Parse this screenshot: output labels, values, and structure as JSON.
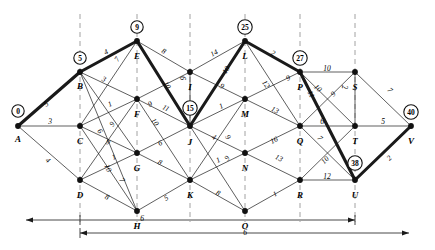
{
  "figure": {
    "type": "network-shortest-path-diagram"
  },
  "nodes": [
    {
      "id": "A",
      "label": "A",
      "x": 18,
      "y": 126,
      "potential": "0",
      "pot_x": 18,
      "pot_y": 111,
      "lab_dx": 0,
      "lab_dy": 8
    },
    {
      "id": "B",
      "label": "B",
      "x": 80,
      "y": 72,
      "potential": "5",
      "pot_x": 80,
      "pot_y": 58,
      "lab_dx": 0,
      "lab_dy": 9
    },
    {
      "id": "C",
      "label": "C",
      "x": 80,
      "y": 126,
      "potential": null,
      "lab_dx": 0,
      "lab_dy": 10
    },
    {
      "id": "D",
      "label": "D",
      "x": 80,
      "y": 180,
      "potential": null,
      "lab_dx": 0,
      "lab_dy": 10
    },
    {
      "id": "E",
      "label": "E",
      "x": 137,
      "y": 41,
      "potential": "9",
      "pot_x": 137,
      "pot_y": 27,
      "lab_dx": 0,
      "lab_dy": 10
    },
    {
      "id": "F",
      "label": "F",
      "x": 137,
      "y": 99,
      "potential": null,
      "lab_dx": 0,
      "lab_dy": 10
    },
    {
      "id": "G",
      "label": "G",
      "x": 137,
      "y": 153,
      "potential": null,
      "lab_dx": 0,
      "lab_dy": 10
    },
    {
      "id": "H",
      "label": "H",
      "x": 137,
      "y": 211,
      "potential": null,
      "lab_dx": 0,
      "lab_dy": 10
    },
    {
      "id": "I",
      "label": "I",
      "x": 190,
      "y": 72,
      "potential": null,
      "lab_dx": 0,
      "lab_dy": 10
    },
    {
      "id": "J",
      "label": "J",
      "x": 190,
      "y": 126,
      "potential": "15",
      "pot_x": 190,
      "pot_y": 108,
      "lab_dx": 0,
      "lab_dy": 11
    },
    {
      "id": "K",
      "label": "K",
      "x": 190,
      "y": 180,
      "potential": null,
      "lab_dx": 0,
      "lab_dy": 10
    },
    {
      "id": "L",
      "label": "L",
      "x": 245,
      "y": 41,
      "potential": "25",
      "pot_x": 245,
      "pot_y": 27,
      "lab_dx": 0,
      "lab_dy": 10
    },
    {
      "id": "M",
      "label": "M",
      "x": 245,
      "y": 99,
      "potential": null,
      "lab_dx": 0,
      "lab_dy": 10
    },
    {
      "id": "N",
      "label": "N",
      "x": 245,
      "y": 153,
      "potential": null,
      "lab_dx": 0,
      "lab_dy": 10
    },
    {
      "id": "O",
      "label": "O",
      "x": 245,
      "y": 211,
      "potential": null,
      "lab_dx": 0,
      "lab_dy": 10
    },
    {
      "id": "P",
      "label": "P",
      "x": 300,
      "y": 72,
      "potential": "27",
      "pot_x": 300,
      "pot_y": 58,
      "lab_dx": 0,
      "lab_dy": 10
    },
    {
      "id": "Q",
      "label": "Q",
      "x": 300,
      "y": 126,
      "potential": null,
      "lab_dx": 0,
      "lab_dy": 10
    },
    {
      "id": "R",
      "label": "R",
      "x": 300,
      "y": 180,
      "potential": null,
      "lab_dx": 0,
      "lab_dy": 10
    },
    {
      "id": "S",
      "label": "S",
      "x": 355,
      "y": 72,
      "potential": null,
      "lab_dx": 0,
      "lab_dy": 10
    },
    {
      "id": "T",
      "label": "T",
      "x": 355,
      "y": 126,
      "potential": null,
      "lab_dx": 0,
      "lab_dy": 10
    },
    {
      "id": "U",
      "label": "U",
      "x": 355,
      "y": 180,
      "potential": "38",
      "pot_x": 355,
      "pot_y": 163,
      "lab_dx": 0,
      "lab_dy": 10
    },
    {
      "id": "V",
      "label": "V",
      "x": 411,
      "y": 126,
      "potential": "40",
      "pot_x": 411,
      "pot_y": 112,
      "lab_dx": 0,
      "lab_dy": 10
    }
  ],
  "edges": [
    {
      "from": "A",
      "to": "B",
      "weight": "5",
      "bold": true,
      "lx": 46,
      "ly": 104
    },
    {
      "from": "A",
      "to": "C",
      "weight": "3",
      "bold": false,
      "lx": 50,
      "ly": 121
    },
    {
      "from": "A",
      "to": "D",
      "weight": "4",
      "bold": false,
      "lx": 48,
      "ly": 160
    },
    {
      "from": "B",
      "to": "E",
      "weight": "4",
      "bold": true,
      "lx": 106,
      "ly": 52
    },
    {
      "from": "B",
      "to": "F",
      "weight": "3",
      "bold": false,
      "lx": 104,
      "ly": 79
    },
    {
      "from": "B",
      "to": "G",
      "weight": "6",
      "bold": false,
      "lx": 100,
      "ly": 131
    },
    {
      "from": "B",
      "to": "H",
      "weight": "10",
      "bold": false,
      "lx": 108,
      "ly": 168
    },
    {
      "from": "C",
      "to": "E",
      "weight": "7",
      "bold": false,
      "lx": 117,
      "ly": 59
    },
    {
      "from": "C",
      "to": "F",
      "weight": "1",
      "bold": false,
      "lx": 110,
      "ly": 104
    },
    {
      "from": "C",
      "to": "G",
      "weight": "9",
      "bold": false,
      "lx": 108,
      "ly": 142
    },
    {
      "from": "C",
      "to": "H",
      "weight": "7",
      "bold": false,
      "lx": 122,
      "ly": 180
    },
    {
      "from": "D",
      "to": "F",
      "weight": "9",
      "bold": false,
      "lx": 112,
      "ly": 124
    },
    {
      "from": "D",
      "to": "G",
      "weight": "1",
      "bold": false,
      "lx": 114,
      "ly": 157
    },
    {
      "from": "D",
      "to": "H",
      "weight": "8",
      "bold": false,
      "lx": 107,
      "ly": 197
    },
    {
      "from": "E",
      "to": "I",
      "weight": "8",
      "bold": false,
      "lx": 164,
      "ly": 51
    },
    {
      "from": "E",
      "to": "J",
      "weight": "10",
      "bold": true,
      "lx": 167,
      "ly": 85
    },
    {
      "from": "F",
      "to": "I",
      "weight": "9",
      "bold": false,
      "lx": 150,
      "ly": 104
    },
    {
      "from": "F",
      "to": "J",
      "weight": "11",
      "bold": false,
      "lx": 166,
      "ly": 108
    },
    {
      "from": "F",
      "to": "K",
      "weight": "10",
      "bold": false,
      "lx": 155,
      "ly": 122
    },
    {
      "from": "G",
      "to": "J",
      "weight": "6",
      "bold": false,
      "lx": 160,
      "ly": 143
    },
    {
      "from": "G",
      "to": "K",
      "weight": "8",
      "bold": false,
      "lx": 160,
      "ly": 162
    },
    {
      "from": "H",
      "to": "K",
      "weight": "5",
      "bold": false,
      "lx": 166,
      "ly": 198
    },
    {
      "from": "I",
      "to": "L",
      "weight": "14",
      "bold": false,
      "lx": 214,
      "ly": 53
    },
    {
      "from": "I",
      "to": "J",
      "weight": "6",
      "bold": false,
      "lx": 182,
      "ly": 78
    },
    {
      "from": "I",
      "to": "M",
      "weight": "9",
      "bold": false,
      "lx": 222,
      "ly": 86
    },
    {
      "from": "J",
      "to": "L",
      "weight": "10",
      "bold": true,
      "lx": 226,
      "ly": 70
    },
    {
      "from": "J",
      "to": "M",
      "weight": "1",
      "bold": false,
      "lx": 221,
      "ly": 106
    },
    {
      "from": "J",
      "to": "N",
      "weight": "4",
      "bold": false,
      "lx": 214,
      "ly": 137
    },
    {
      "from": "J",
      "to": "O",
      "weight": "9",
      "bold": false,
      "lx": 228,
      "ly": 137
    },
    {
      "from": "K",
      "to": "N",
      "weight": "1",
      "bold": false,
      "lx": 218,
      "ly": 160
    },
    {
      "from": "K",
      "to": "O",
      "weight": "8",
      "bold": false,
      "lx": 218,
      "ly": 193
    },
    {
      "from": "K",
      "to": "M",
      "weight": "9",
      "bold": false,
      "lx": 227,
      "ly": 158
    },
    {
      "from": "L",
      "to": "P",
      "weight": "2",
      "bold": true,
      "lx": 273,
      "ly": 53
    },
    {
      "from": "L",
      "to": "Q",
      "weight": "12",
      "bold": false,
      "lx": 266,
      "ly": 84
    },
    {
      "from": "M",
      "to": "P",
      "weight": "9",
      "bold": false,
      "lx": 288,
      "ly": 78
    },
    {
      "from": "M",
      "to": "Q",
      "weight": "13",
      "bold": false,
      "lx": 275,
      "ly": 110
    },
    {
      "from": "N",
      "to": "Q",
      "weight": "16",
      "bold": false,
      "lx": 274,
      "ly": 140
    },
    {
      "from": "N",
      "to": "R",
      "weight": "13",
      "bold": false,
      "lx": 279,
      "ly": 158
    },
    {
      "from": "O",
      "to": "R",
      "weight": "1",
      "bold": false,
      "lx": 275,
      "ly": 194
    },
    {
      "from": "P",
      "to": "S",
      "weight": "10",
      "bold": false,
      "lx": 327,
      "ly": 68
    },
    {
      "from": "P",
      "to": "U",
      "weight": "11",
      "bold": true,
      "lx": 311,
      "ly": 94
    },
    {
      "from": "P",
      "to": "T",
      "weight": "10",
      "bold": false,
      "lx": 318,
      "ly": 88
    },
    {
      "from": "Q",
      "to": "T",
      "weight": "6",
      "bold": false,
      "lx": 322,
      "ly": 121
    },
    {
      "from": "Q",
      "to": "U",
      "weight": "7",
      "bold": false,
      "lx": 320,
      "ly": 138
    },
    {
      "from": "Q",
      "to": "S",
      "weight": "9",
      "bold": false,
      "lx": 333,
      "ly": 94
    },
    {
      "from": "R",
      "to": "U",
      "weight": "12",
      "bold": false,
      "lx": 327,
      "ly": 176
    },
    {
      "from": "R",
      "to": "T",
      "weight": "10",
      "bold": false,
      "lx": 325,
      "ly": 160
    },
    {
      "from": "S",
      "to": "T",
      "weight": "2",
      "bold": false,
      "lx": 344,
      "ly": 87
    },
    {
      "from": "S",
      "to": "V",
      "weight": "7",
      "bold": false,
      "lx": 390,
      "ly": 90
    },
    {
      "from": "T",
      "to": "V",
      "weight": "5",
      "bold": false,
      "lx": 383,
      "ly": 121
    },
    {
      "from": "U",
      "to": "V",
      "weight": "2",
      "bold": true,
      "lx": 389,
      "ly": 158
    }
  ],
  "bold_path": [
    "A",
    "B",
    "E",
    "J",
    "L",
    "P",
    "U",
    "V"
  ],
  "dashed_columns": [
    80,
    137,
    190,
    245,
    300,
    355
  ],
  "scale_bars": [
    {
      "name": "upper-scale-bar",
      "label": "6",
      "label_x": 142,
      "label_y": 218
    },
    {
      "name": "lower-scale-bar",
      "label": "6",
      "label_x": 245,
      "label_y": 232
    }
  ]
}
